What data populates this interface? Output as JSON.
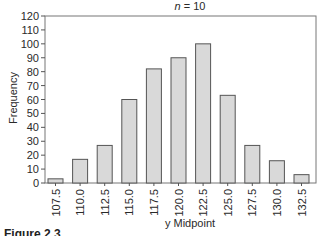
{
  "chart_data": {
    "type": "bar",
    "title": "n = 10",
    "title_var": "n",
    "title_value": "= 10",
    "xlabel": "y Midpoint",
    "ylabel": "Frequency",
    "categories": [
      "107.5",
      "110.0",
      "112.5",
      "115.0",
      "117.5",
      "120.0",
      "122.5",
      "125.0",
      "127.5",
      "130.0",
      "132.5"
    ],
    "values": [
      3,
      17,
      27,
      60,
      82,
      90,
      100,
      63,
      27,
      16,
      6
    ],
    "ylim": [
      0,
      120
    ],
    "yticks": [
      0,
      10,
      20,
      30,
      40,
      50,
      60,
      70,
      80,
      90,
      100,
      110,
      120
    ],
    "grid": false,
    "legend": null,
    "bar_fill": "#d9d9d9",
    "bar_edge": "#555555",
    "frame": true
  },
  "caption": "Figure 2.3 ..."
}
